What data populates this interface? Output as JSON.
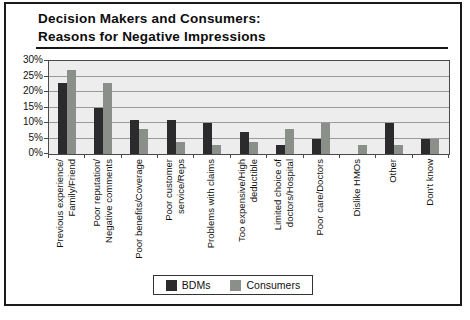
{
  "title": {
    "line1": "Decision Makers and Consumers:",
    "line2": "Reasons for Negative Impressions"
  },
  "chart_data": {
    "type": "bar",
    "categories": [
      "Previous experience/\nFamily/Friend",
      "Poor reputation/\nNegative comments",
      "Poor benefits/Coverage",
      "Poor customer\nservice/Reps",
      "Problems with claims",
      "Too expensive/High\ndeductible",
      "Limited choice of\ndoctors/Hospital",
      "Poor care/Doctors",
      "Dislike HMOs",
      "Other",
      "Don't know"
    ],
    "series": [
      {
        "name": "BDMs",
        "color": "#2b2b2e",
        "values": [
          23,
          15,
          11,
          11,
          10,
          7,
          3,
          5,
          0,
          10,
          5
        ]
      },
      {
        "name": "Consumers",
        "color": "#8a9089",
        "values": [
          27,
          23,
          8,
          4,
          3,
          4,
          8,
          10,
          3,
          3,
          5
        ]
      }
    ],
    "ylabel": "",
    "ylim": [
      0,
      30
    ],
    "ytick_step": 5,
    "ytick_labels": [
      "0%",
      "5%",
      "10%",
      "15%",
      "20%",
      "25%",
      "30%"
    ],
    "grid": true,
    "legend_position": "bottom-center",
    "plot_background": "#ededed",
    "gridline_color": "#9a9a9a"
  }
}
